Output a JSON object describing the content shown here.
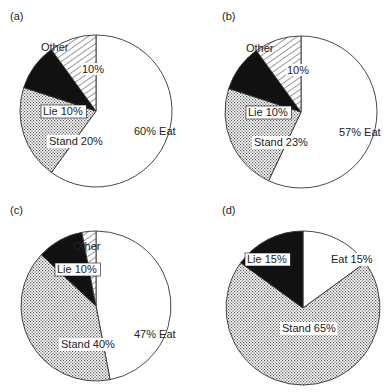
{
  "chart_data": [
    {
      "type": "pie",
      "panel": "(a)",
      "categories": [
        "Eat",
        "Stand",
        "Lie",
        "Other"
      ],
      "values": [
        60,
        20,
        10,
        10
      ],
      "labels": [
        "60% Eat",
        "Stand 20%",
        "Lie 10%",
        "10%"
      ],
      "other_caption": "Other",
      "start_angle": "12 o'clock, clockwise"
    },
    {
      "type": "pie",
      "panel": "(b)",
      "categories": [
        "Eat",
        "Stand",
        "Lie",
        "Other"
      ],
      "values": [
        57,
        23,
        10,
        10
      ],
      "labels": [
        "57% Eat",
        "Stand 23%",
        "Lie 10%",
        "10%"
      ],
      "other_caption": "Other",
      "start_angle": "12 o'clock, clockwise"
    },
    {
      "type": "pie",
      "panel": "(c)",
      "categories": [
        "Eat",
        "Stand",
        "Lie",
        "Other"
      ],
      "values": [
        47,
        40,
        10,
        3
      ],
      "labels": [
        "47% Eat",
        "Stand 40%",
        "Lie 10%",
        ""
      ],
      "other_caption": "Other",
      "start_angle": "12 o'clock, clockwise"
    },
    {
      "type": "pie",
      "panel": "(d)",
      "categories": [
        "Eat",
        "Stand",
        "Lie"
      ],
      "values": [
        15,
        70,
        15
      ],
      "labels": [
        "Eat 15%",
        "Stand 65%",
        "Lie 15%"
      ],
      "other_caption": "",
      "start_angle": "12 o'clock, clockwise"
    }
  ],
  "legend": {
    "Eat": "white fill",
    "Stand": "dotted fill",
    "Lie": "black fill",
    "Other": "diagonal hatch fill"
  },
  "colors": {
    "eat": "#ffffff",
    "stand_dots": "#555555",
    "lie": "#111111",
    "outline": "#333333"
  }
}
